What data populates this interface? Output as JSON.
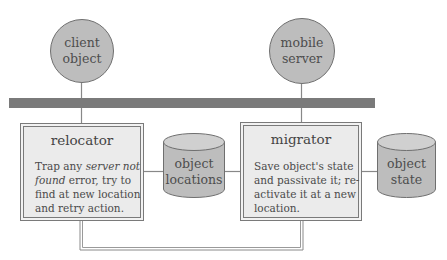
{
  "diagram": {
    "type": "architecture",
    "colors": {
      "node_fill": "#bdbdbd",
      "node_stroke": "#6f6f6f",
      "bus_fill": "#7a7a7a",
      "box_fill": "#ececec",
      "box_stroke": "#777777",
      "connector": "#888888",
      "text": "#4a4a4a"
    },
    "nodes": {
      "client": {
        "line1": "client",
        "line2": "object"
      },
      "server": {
        "line1": "mobile",
        "line2": "server"
      }
    },
    "stores": {
      "locations": {
        "line1": "object",
        "line2": "locations"
      },
      "state": {
        "line1": "object",
        "line2": "state"
      }
    },
    "boxes": {
      "relocator": {
        "title": "relocator",
        "lines": [
          {
            "parts": [
              {
                "text": "Trap any ",
                "italic": false
              },
              {
                "text": "server not",
                "italic": true
              }
            ]
          },
          {
            "parts": [
              {
                "text": "found",
                "italic": true
              },
              {
                "text": " error, try to",
                "italic": false
              }
            ]
          },
          {
            "parts": [
              {
                "text": "find at new location",
                "italic": false
              }
            ]
          },
          {
            "parts": [
              {
                "text": "and retry action.",
                "italic": false
              }
            ]
          }
        ]
      },
      "migrator": {
        "title": "migrator",
        "lines": [
          {
            "parts": [
              {
                "text": "Save object's state",
                "italic": false
              }
            ]
          },
          {
            "parts": [
              {
                "text": "and passivate it; re-",
                "italic": false
              }
            ]
          },
          {
            "parts": [
              {
                "text": "activate it at a new",
                "italic": false
              }
            ]
          },
          {
            "parts": [
              {
                "text": "location.",
                "italic": false
              }
            ]
          }
        ]
      }
    }
  }
}
